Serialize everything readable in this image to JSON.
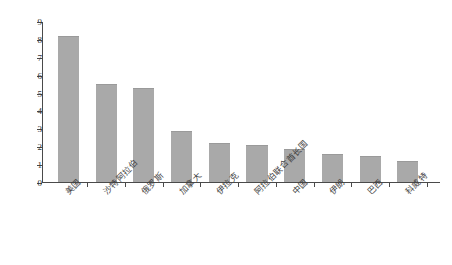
{
  "chart_data": {
    "type": "bar",
    "title": "",
    "subtitle": "",
    "xlabel": "",
    "ylabel": "产量（亿吨）",
    "ylim": [
      0,
      9
    ],
    "yticks": [
      "0",
      "1",
      "2",
      "3",
      "4",
      "5",
      "6",
      "7",
      "8",
      "9"
    ],
    "grid": false,
    "legend": false,
    "legend_position": "none",
    "bar_color": "#a9a9a9",
    "axis_color": "#4a4a4a",
    "categories": [
      "美国",
      "沙特阿拉伯",
      "俄罗斯",
      "加拿大",
      "伊拉克",
      "阿拉伯联合酋长国",
      "中国",
      "伊朗",
      "巴西",
      "科威特"
    ],
    "values": [
      8.1,
      5.4,
      5.2,
      2.8,
      2.1,
      2.0,
      1.8,
      1.5,
      1.4,
      1.1
    ]
  }
}
